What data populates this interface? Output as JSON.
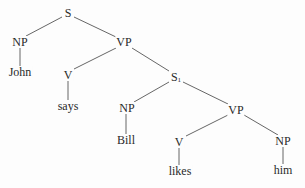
{
  "diagram": {
    "type": "syntax-tree",
    "nodes": [
      {
        "id": "S",
        "label": "S",
        "sub": "",
        "x": 68,
        "y": 13
      },
      {
        "id": "NP1",
        "label": "NP",
        "sub": "",
        "x": 20,
        "y": 42
      },
      {
        "id": "VP1",
        "label": "VP",
        "sub": "",
        "x": 124,
        "y": 42
      },
      {
        "id": "John",
        "label": "John",
        "sub": "",
        "x": 20,
        "y": 72
      },
      {
        "id": "V1",
        "label": "V",
        "sub": "",
        "x": 68,
        "y": 75
      },
      {
        "id": "S1",
        "label": "S",
        "sub": "1",
        "x": 176,
        "y": 77
      },
      {
        "id": "says",
        "label": "says",
        "sub": "",
        "x": 68,
        "y": 106
      },
      {
        "id": "NP2",
        "label": "NP",
        "sub": "",
        "x": 127,
        "y": 108
      },
      {
        "id": "VP2",
        "label": "VP",
        "sub": "",
        "x": 236,
        "y": 110
      },
      {
        "id": "Bill",
        "label": "Bill",
        "sub": "",
        "x": 126,
        "y": 140
      },
      {
        "id": "V2",
        "label": "V",
        "sub": "",
        "x": 179,
        "y": 142
      },
      {
        "id": "NP3",
        "label": "NP",
        "sub": "",
        "x": 283,
        "y": 141
      },
      {
        "id": "likes",
        "label": "likes",
        "sub": "",
        "x": 180,
        "y": 171
      },
      {
        "id": "him",
        "label": "him",
        "sub": "",
        "x": 283,
        "y": 170
      }
    ],
    "edges": [
      {
        "from": "S",
        "to": "NP1",
        "x1": 62,
        "y1": 17,
        "x2": 26,
        "y2": 36
      },
      {
        "from": "S",
        "to": "VP1",
        "x1": 74,
        "y1": 17,
        "x2": 116,
        "y2": 37
      },
      {
        "from": "NP1",
        "to": "John",
        "x1": 20,
        "y1": 48,
        "x2": 20,
        "y2": 66
      },
      {
        "from": "VP1",
        "to": "V1",
        "x1": 116,
        "y1": 48,
        "x2": 74,
        "y2": 69
      },
      {
        "from": "VP1",
        "to": "S1",
        "x1": 132,
        "y1": 48,
        "x2": 169,
        "y2": 71
      },
      {
        "from": "V1",
        "to": "says",
        "x1": 68,
        "y1": 81,
        "x2": 68,
        "y2": 100
      },
      {
        "from": "S1",
        "to": "NP2",
        "x1": 169,
        "y1": 82,
        "x2": 134,
        "y2": 102
      },
      {
        "from": "S1",
        "to": "VP2",
        "x1": 183,
        "y1": 82,
        "x2": 228,
        "y2": 104
      },
      {
        "from": "NP2",
        "to": "Bill",
        "x1": 126,
        "y1": 114,
        "x2": 126,
        "y2": 134
      },
      {
        "from": "VP2",
        "to": "V2",
        "x1": 228,
        "y1": 115,
        "x2": 186,
        "y2": 136
      },
      {
        "from": "VP2",
        "to": "NP3",
        "x1": 244,
        "y1": 115,
        "x2": 278,
        "y2": 135
      },
      {
        "from": "V2",
        "to": "likes",
        "x1": 179,
        "y1": 148,
        "x2": 179,
        "y2": 165
      },
      {
        "from": "NP3",
        "to": "him",
        "x1": 283,
        "y1": 147,
        "x2": 283,
        "y2": 164
      }
    ]
  }
}
